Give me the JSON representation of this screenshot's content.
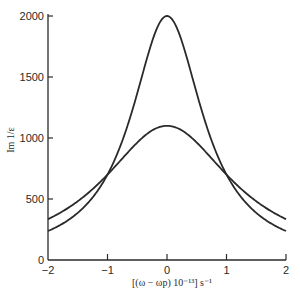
{
  "chart_data": {
    "type": "line",
    "title": "",
    "xlabel": "[(ω − ωp) 10⁻¹³] s⁻¹",
    "ylabel": "Im 1/ε",
    "xlim": [
      -2,
      2
    ],
    "ylim": [
      0,
      2000
    ],
    "x_ticks": [
      -2,
      -1,
      0,
      1,
      2
    ],
    "x_tick_labels": [
      "−2",
      "−1",
      "0",
      "1",
      "2"
    ],
    "y_ticks": [
      0,
      500,
      1000,
      1500,
      2000
    ],
    "y_tick_labels": [
      "0",
      "500",
      "1000",
      "1500",
      "2000"
    ],
    "grid": false,
    "legend": null,
    "x": [
      -2,
      -1.5,
      -1,
      -0.5,
      0,
      0.5,
      1,
      1.5,
      2
    ],
    "series": [
      {
        "name": "narrow peak",
        "shape": "lorentzian",
        "peak": 2000,
        "half_width": 0.734,
        "values": [
          237,
          386,
          700,
          1364,
          2000,
          1364,
          700,
          386,
          237
        ]
      },
      {
        "name": "broad peak",
        "shape": "lorentzian",
        "peak": 1100,
        "half_width": 1.323,
        "values": [
          335,
          481,
          700,
          962,
          1100,
          962,
          700,
          481,
          335
        ]
      }
    ],
    "line_color": "#2a2a2a"
  }
}
